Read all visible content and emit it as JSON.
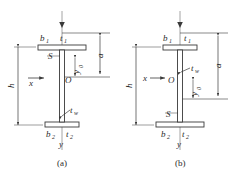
{
  "figure": {
    "type": "engineering-diagram",
    "background_color": "#ffffff",
    "line_color": "#3a3a3a",
    "text_color": "#2b2b2b",
    "axis_color": "#8a8a8a",
    "panels": [
      {
        "id": "a",
        "caption": "(a)",
        "description": "I-section with larger top flange; shear center S above centroid O",
        "labels": {
          "top_flange_width": "b",
          "top_flange_width_sub": "1",
          "top_flange_thickness": "t",
          "top_flange_thickness_sub": "1",
          "bottom_flange_width": "b",
          "bottom_flange_width_sub": "2",
          "bottom_flange_thickness": "t",
          "bottom_flange_thickness_sub": "2",
          "web_thickness": "t",
          "web_thickness_sub": "w",
          "depth": "h",
          "distance_a": "a",
          "offset": "y",
          "offset_sub": "0",
          "shear_center": "S",
          "centroid": "O",
          "x_axis": "x",
          "y_axis": "y"
        }
      },
      {
        "id": "b",
        "caption": "(b)",
        "description": "I-section with larger bottom flange; centroid O above shear center S",
        "labels": {
          "top_flange_width": "b",
          "top_flange_width_sub": "1",
          "top_flange_thickness": "t",
          "top_flange_thickness_sub": "1",
          "bottom_flange_width": "b",
          "bottom_flange_width_sub": "2",
          "bottom_flange_thickness": "t",
          "bottom_flange_thickness_sub": "2",
          "web_thickness": "t",
          "web_thickness_sub": "w",
          "depth": "h",
          "distance_a": "a",
          "offset": "y",
          "offset_sub": "0",
          "shear_center": "S",
          "centroid": "O",
          "x_axis": "x",
          "y_axis": "y"
        }
      }
    ]
  }
}
